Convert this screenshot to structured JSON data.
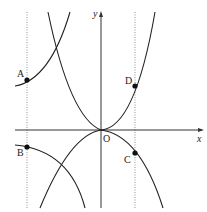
{
  "figure": {
    "axes": {
      "x_label": "x",
      "y_label": "y",
      "origin_label": "O"
    },
    "points": [
      {
        "name": "A",
        "x": 27,
        "y": 80
      },
      {
        "name": "B",
        "x": 27,
        "y": 147
      },
      {
        "name": "C",
        "x": 135,
        "y": 153
      },
      {
        "name": "D",
        "x": 135,
        "y": 86
      }
    ],
    "colors": {
      "curve": "#222222",
      "axis": "#333333",
      "guide": "#666666"
    }
  }
}
